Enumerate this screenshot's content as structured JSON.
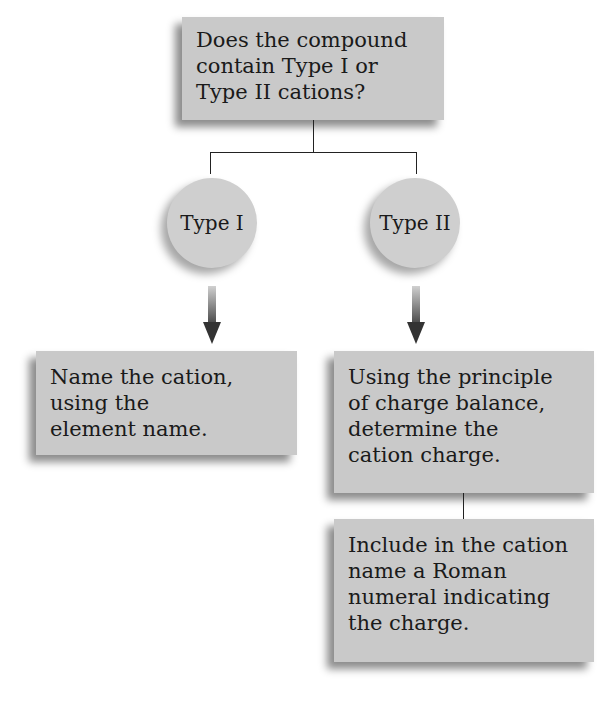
{
  "diagram": {
    "question": "Does the compound contain Type I or Type II cations?",
    "question_lines": [
      "Does the compound",
      "contain Type I or",
      "Type II cations?"
    ],
    "branches": [
      {
        "label": "Type I",
        "steps": [
          {
            "lines": [
              "Name the cation,",
              "using the",
              "element name."
            ]
          }
        ]
      },
      {
        "label": "Type II",
        "steps": [
          {
            "lines": [
              "Using the principle",
              "of charge balance,",
              "determine the",
              "cation charge."
            ]
          },
          {
            "lines": [
              "Include in the cation",
              "name a Roman",
              "numeral indicating",
              "the charge."
            ]
          }
        ]
      }
    ],
    "colors": {
      "box": "#c9c9c9",
      "circle": "#cfcfcf",
      "arrow": "#3a3a3a",
      "line": "#222222"
    }
  }
}
